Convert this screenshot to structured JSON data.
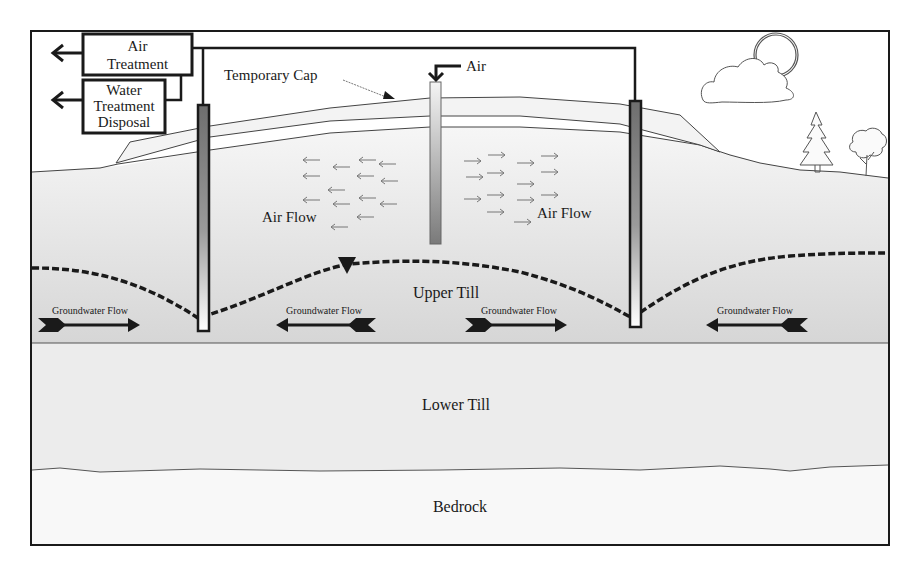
{
  "diagram": {
    "treatment_boxes": [
      {
        "lines": [
          "Air",
          "Treatment"
        ]
      },
      {
        "lines": [
          "Water",
          "Treatment",
          "Disposal"
        ]
      }
    ],
    "labels": {
      "temporary_cap": "Temporary Cap",
      "air_injection": "Air",
      "air_flow_left": "Air Flow",
      "air_flow_right": "Air Flow",
      "upper_till": "Upper Till",
      "lower_till": "Lower Till",
      "bedrock": "Bedrock"
    },
    "groundwater_flow": [
      {
        "label": "Groundwater Flow",
        "direction": "right"
      },
      {
        "label": "Groundwater Flow",
        "direction": "left"
      },
      {
        "label": "Groundwater Flow",
        "direction": "right"
      },
      {
        "label": "Groundwater Flow",
        "direction": "left"
      }
    ],
    "layers": [
      {
        "name": "Upper Till",
        "color": "#e6e6e6"
      },
      {
        "name": "Lower Till",
        "color": "#ebebeb"
      },
      {
        "name": "Bedrock",
        "color": "#f7f7f7"
      }
    ],
    "icons": [
      "sun-icon",
      "cloud-icon",
      "pine-tree-icon",
      "deciduous-tree-icon",
      "water-table-marker-icon"
    ],
    "colors": {
      "line": "#1a1a1a",
      "well_dark": "#5a5a5a",
      "upper_fill": "#e4e4e4",
      "lower_fill": "#ececec",
      "bedrock_fill": "#f8f8f8",
      "cap_fill": "#f2f2f2"
    }
  }
}
